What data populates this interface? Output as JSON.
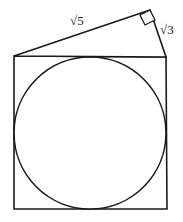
{
  "figure": {
    "background_color": "#ffffff",
    "stroke_color": "#1a1a1a",
    "fill_color": "#ffffff",
    "labels": {
      "hypotenuse_label": "√5",
      "short_leg_label": "√3",
      "right_angle_marker": "right-angle-mark"
    },
    "shapes": {
      "square": {
        "name": "square",
        "top_left": [
          14,
          56
        ],
        "top_right": [
          166,
          57
        ],
        "bottom_right": [
          167,
          209
        ],
        "bottom_left": [
          14,
          209
        ]
      },
      "circle": {
        "name": "inscribed-circle",
        "center": [
          90,
          133
        ],
        "radius": 76
      },
      "triangle": {
        "name": "right-triangle",
        "vertices": [
          [
            14,
            56
          ],
          [
            150,
            10
          ],
          [
            166,
            57
          ]
        ],
        "right_angle_at": [
          150,
          10
        ]
      }
    }
  }
}
